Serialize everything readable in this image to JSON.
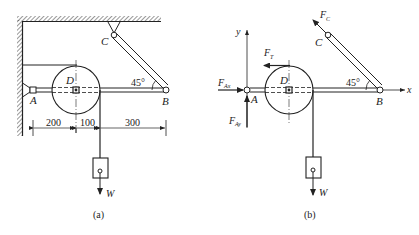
{
  "figure": {
    "panels": [
      {
        "id": "a",
        "caption": "(a)",
        "labels": {
          "A": "A",
          "B": "B",
          "C": "C",
          "D": "D",
          "angle": "45°",
          "weight": "W"
        },
        "dimensions": [
          "200",
          "100",
          "300"
        ]
      },
      {
        "id": "b",
        "caption": "(b)",
        "labels": {
          "A": "A",
          "B": "B",
          "C": "C",
          "D": "D",
          "angle": "45°",
          "weight": "W",
          "x_axis": "x",
          "y_axis": "y"
        },
        "forces": {
          "FAx": {
            "main": "F",
            "sub": "Ax"
          },
          "FAy": {
            "main": "F",
            "sub": "Ay"
          },
          "FT": {
            "main": "F",
            "sub": "T"
          },
          "FC": {
            "main": "F",
            "sub": "C"
          }
        }
      }
    ],
    "colors": {
      "ink": "#222222",
      "background": "#ffffff"
    }
  }
}
